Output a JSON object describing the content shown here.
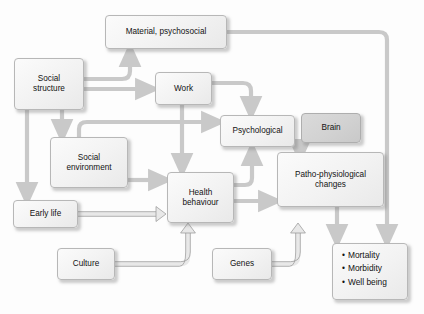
{
  "diagram": {
    "palette": {
      "box_fill_light": "#f2f2f2",
      "box_fill_shaded": "#d2d2d2",
      "box_border": "#b7b7b7",
      "arrow_light": "#c9c9c9",
      "arrow_outline": "#9a9a9a",
      "text": "#121212",
      "background": "#fdfdfd"
    },
    "nodes": [
      {
        "id": "material",
        "label": "Material, psychosocial",
        "style": "light",
        "x": 105,
        "y": 15,
        "w": 122,
        "h": 34
      },
      {
        "id": "social_structure",
        "label_line1": "Social",
        "label_line2": "structure",
        "style": "light",
        "x": 14,
        "y": 58,
        "w": 70,
        "h": 52
      },
      {
        "id": "work",
        "label": "Work",
        "style": "light",
        "x": 155,
        "y": 72,
        "w": 57,
        "h": 33
      },
      {
        "id": "psychological",
        "label": "Psychological",
        "style": "light",
        "x": 220,
        "y": 115,
        "w": 75,
        "h": 32
      },
      {
        "id": "brain",
        "label": "Brain",
        "style": "shaded",
        "x": 301,
        "y": 113,
        "w": 60,
        "h": 30
      },
      {
        "id": "social_environment",
        "label_line1": "Social",
        "label_line2": "environment",
        "style": "light",
        "x": 50,
        "y": 137,
        "w": 78,
        "h": 51
      },
      {
        "id": "patho",
        "label_line1": "Patho-physiological",
        "label_line2": "changes",
        "style": "light",
        "x": 277,
        "y": 152,
        "w": 107,
        "h": 55
      },
      {
        "id": "health_behaviour",
        "label_line1": "Health",
        "label_line2": "behaviour",
        "style": "light",
        "x": 167,
        "y": 172,
        "w": 67,
        "h": 51
      },
      {
        "id": "early_life",
        "label": "Early life",
        "style": "light",
        "x": 13,
        "y": 200,
        "w": 65,
        "h": 28
      },
      {
        "id": "genes",
        "label": "Genes",
        "style": "light",
        "x": 212,
        "y": 248,
        "w": 60,
        "h": 32
      },
      {
        "id": "culture",
        "label": "Culture",
        "style": "light",
        "x": 57,
        "y": 248,
        "w": 58,
        "h": 32
      },
      {
        "id": "outcomes",
        "style": "light",
        "x": 332,
        "y": 243,
        "w": 76,
        "h": 57,
        "bullets": [
          "Mortality",
          "Morbidity",
          "Well being"
        ]
      }
    ],
    "edges": [
      {
        "id": "social-structure-to-material",
        "from": "social_structure",
        "to": "material",
        "kind": "filled"
      },
      {
        "id": "social-structure-to-work",
        "from": "social_structure",
        "to": "work",
        "kind": "filled"
      },
      {
        "id": "social-structure-to-social-environment",
        "from": "social_structure",
        "to": "social_environment",
        "kind": "filled"
      },
      {
        "id": "social-structure-to-early-life",
        "from": "social_structure",
        "to": "early_life",
        "kind": "filled"
      },
      {
        "id": "social-environment-to-psychological",
        "from": "social_environment",
        "to": "psychological",
        "kind": "filled"
      },
      {
        "id": "social-environment-to-health-behaviour",
        "from": "social_environment",
        "to": "health_behaviour",
        "kind": "filled"
      },
      {
        "id": "work-to-psychological",
        "from": "work",
        "to": "psychological",
        "kind": "filled"
      },
      {
        "id": "work-to-health-behaviour",
        "from": "work",
        "to": "health_behaviour",
        "kind": "filled"
      },
      {
        "id": "material-to-outcomes",
        "from": "material",
        "to": "outcomes",
        "kind": "filled"
      },
      {
        "id": "health-behaviour-to-psychological",
        "from": "health_behaviour",
        "to": "psychological",
        "kind": "filled"
      },
      {
        "id": "health-behaviour-to-patho",
        "from": "health_behaviour",
        "to": "patho",
        "kind": "filled"
      },
      {
        "id": "psychological-to-patho",
        "from": "psychological",
        "to": "patho",
        "kind": "filled"
      },
      {
        "id": "patho-to-outcomes",
        "from": "patho",
        "to": "outcomes",
        "kind": "filled"
      },
      {
        "id": "early-life-to-health-behaviour",
        "from": "early_life",
        "to": "health_behaviour",
        "kind": "outlined"
      },
      {
        "id": "culture-to-health-behaviour",
        "from": "culture",
        "to": "health_behaviour",
        "kind": "outlined"
      },
      {
        "id": "genes-to-patho",
        "from": "genes",
        "to": "patho",
        "kind": "outlined"
      }
    ]
  }
}
